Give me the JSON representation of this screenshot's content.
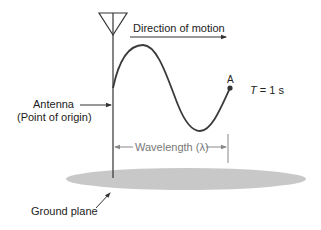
{
  "diagram": {
    "labels": {
      "direction": "Direction of motion",
      "point_a": "A",
      "period_symbol": "T",
      "period_value": " = 1 s",
      "antenna": "Antenna",
      "antenna_sub": "(Point of origin)",
      "wavelength": "Wavelength (λ)",
      "ground_plane": "Ground plane"
    },
    "colors": {
      "line": "#333333",
      "wave": "#3a3a3a",
      "dimension": "#888888",
      "ground": "#c8c8c8"
    }
  }
}
